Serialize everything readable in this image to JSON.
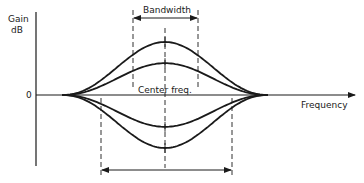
{
  "diagram": {
    "y_axis": {
      "label_line1": "Gain",
      "label_line2": "dB",
      "zero_label": "0"
    },
    "x_axis": {
      "label": "Frequency"
    },
    "center_label": "Center freq.",
    "bandwidth_top_label": "Bandwidth",
    "bandwidth_bottom_label": "Bandwidth",
    "curves": [
      {
        "name": "boost-large",
        "relative_gain": 1.0
      },
      {
        "name": "boost-small",
        "relative_gain": 0.6
      },
      {
        "name": "cut-small",
        "relative_gain": -0.6
      },
      {
        "name": "cut-large",
        "relative_gain": -1.0
      }
    ]
  }
}
